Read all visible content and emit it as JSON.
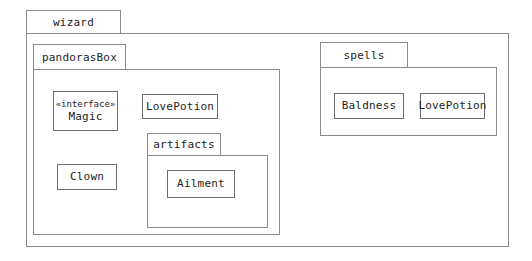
{
  "diagram": {
    "type": "uml-package-diagram",
    "title": "wizard",
    "stroke_color": "#8a8a8a",
    "class_stroke_color": "#6e6e6e",
    "text_color": "#1d1d1d",
    "background": "#ffffff"
  },
  "packages": [
    {
      "id": "wizard",
      "label": "wizard",
      "tab": {
        "x": 26,
        "y": 10,
        "w": 95,
        "h": 24
      },
      "body": {
        "x": 26,
        "y": 33,
        "w": 483,
        "h": 214
      }
    },
    {
      "id": "pandorasBox",
      "label": "pandorasBox",
      "tab": {
        "x": 33,
        "y": 44,
        "w": 93,
        "h": 26
      },
      "body": {
        "x": 33,
        "y": 69,
        "w": 247,
        "h": 166
      }
    },
    {
      "id": "artifacts",
      "label": "artifacts",
      "tab": {
        "x": 147,
        "y": 133,
        "w": 74,
        "h": 23
      },
      "body": {
        "x": 147,
        "y": 155,
        "w": 121,
        "h": 73
      }
    },
    {
      "id": "spells",
      "label": "spells",
      "tab": {
        "x": 320,
        "y": 42,
        "w": 88,
        "h": 26
      },
      "body": {
        "x": 320,
        "y": 67,
        "w": 177,
        "h": 69
      }
    }
  ],
  "classes": [
    {
      "id": "magic",
      "name": "Magic",
      "stereotype": "«interface»",
      "package": "pandorasBox",
      "box": {
        "x": 53,
        "y": 91,
        "w": 65,
        "h": 40
      }
    },
    {
      "id": "clown",
      "name": "Clown",
      "stereotype": "",
      "package": "pandorasBox",
      "box": {
        "x": 57,
        "y": 164,
        "w": 60,
        "h": 26
      }
    },
    {
      "id": "lovepotion_pandoras",
      "name": "LovePotion",
      "stereotype": "",
      "package": "pandorasBox",
      "box": {
        "x": 142,
        "y": 94,
        "w": 76,
        "h": 25
      }
    },
    {
      "id": "ailment",
      "name": "Ailment",
      "stereotype": "",
      "package": "artifacts",
      "box": {
        "x": 167,
        "y": 170,
        "w": 68,
        "h": 28
      }
    },
    {
      "id": "baldness",
      "name": "Baldness",
      "stereotype": "",
      "package": "spells",
      "box": {
        "x": 334,
        "y": 93,
        "w": 70,
        "h": 26
      }
    },
    {
      "id": "lovepotion_spells",
      "name": "LovePotion",
      "stereotype": "",
      "package": "spells",
      "box": {
        "x": 420,
        "y": 93,
        "w": 65,
        "h": 26
      }
    }
  ],
  "relationships": [
    {
      "id": "clown-realizes-magic",
      "kind": "realization",
      "line_style": "dashed",
      "arrowhead": "hollow-triangle",
      "from": "clown",
      "to": "magic"
    },
    {
      "id": "baldness-extends-ailment",
      "kind": "generalization",
      "line_style": "solid",
      "arrowhead": "hollow-triangle",
      "from": "baldness",
      "to": "ailment"
    }
  ]
}
